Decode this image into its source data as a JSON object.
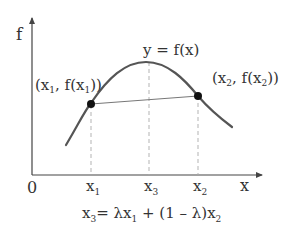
{
  "diagram": {
    "y_axis_label": "f",
    "x_axis_label": "x",
    "origin_label": "0",
    "curve_label": "y = f(x)",
    "points": [
      {
        "id": "p1",
        "label_main": "(x",
        "label_sub": "1",
        "label_mid": ", f(x",
        "label_sub2": "1",
        "label_end": "))"
      },
      {
        "id": "p2",
        "label_main": "(x",
        "label_sub": "2",
        "label_mid": ", f(x",
        "label_sub2": "2",
        "label_end": "))"
      }
    ],
    "ticks": [
      {
        "base": "x",
        "sub": "1"
      },
      {
        "base": "x",
        "sub": "3"
      },
      {
        "base": "x",
        "sub": "2"
      }
    ],
    "formula": {
      "lhs_base": "x",
      "lhs_sub": "3",
      "rhs_a": "= λx",
      "rhs_a_sub": "1",
      "rhs_b": " + (1 – λ)x",
      "rhs_b_sub": "2"
    },
    "colors": {
      "axis": "#444444",
      "curve": "#555555",
      "chord": "#777777",
      "dash": "#aaaaaa",
      "point": "#111111",
      "text": "#333333"
    }
  }
}
